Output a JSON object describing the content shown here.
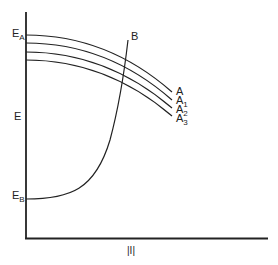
{
  "diagram": {
    "title": "",
    "axes": {
      "y_label": "E",
      "x_label": "|I|",
      "y_ticks": [
        {
          "base": "E",
          "sub": "A"
        },
        {
          "base": "E",
          "sub": "B"
        }
      ]
    },
    "curves": [
      {
        "name": "A",
        "label_base": "A",
        "label_sub": "",
        "type": "decreasing"
      },
      {
        "name": "A1",
        "label_base": "A",
        "label_sub": "1",
        "type": "decreasing"
      },
      {
        "name": "A2",
        "label_base": "A",
        "label_sub": "2",
        "type": "decreasing"
      },
      {
        "name": "A3",
        "label_base": "A",
        "label_sub": "3",
        "type": "decreasing"
      },
      {
        "name": "B",
        "label_base": "B",
        "label_sub": "",
        "type": "increasing"
      }
    ],
    "line_color": "#222222",
    "background": "#ffffff"
  }
}
